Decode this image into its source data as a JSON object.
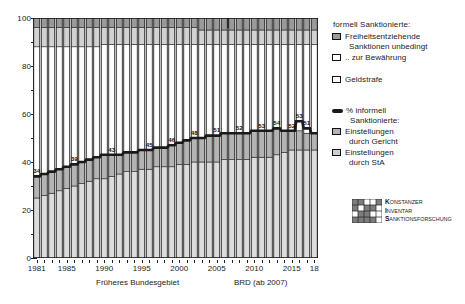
{
  "chart_data": {
    "type": "area",
    "title": "",
    "xlabel": "",
    "ylabel": "",
    "ylim": [
      0,
      100
    ],
    "xlim": [
      1981,
      2018
    ],
    "grid": false,
    "legend_position": "right",
    "y_ticks": [
      "0",
      "20",
      "40",
      "60",
      "80",
      "100"
    ],
    "y_tick_values": [
      0,
      20,
      40,
      60,
      80,
      100
    ],
    "y_minor_values": [
      10,
      30,
      50,
      70,
      90
    ],
    "x_ticks": [
      "1981",
      "1985",
      "1990",
      "1995",
      "2000",
      "2005",
      "2010",
      "2015",
      "18"
    ],
    "x_tick_values": [
      1981,
      1985,
      1990,
      1995,
      2000,
      2005,
      2010,
      2015,
      2018
    ],
    "x": [
      1981,
      1982,
      1983,
      1984,
      1985,
      1986,
      1987,
      1988,
      1989,
      1990,
      1991,
      1992,
      1993,
      1994,
      1995,
      1996,
      1997,
      1998,
      1999,
      2000,
      2001,
      2002,
      2003,
      2004,
      2005,
      2006,
      2007,
      2008,
      2009,
      2010,
      2011,
      2012,
      2013,
      2014,
      2015,
      2016,
      2017,
      2018
    ],
    "series": [
      {
        "name": "Einstellungen durch StA",
        "key": "einstellungen_sta",
        "color": "#dcdcdc",
        "values": [
          25,
          26,
          27,
          28,
          29,
          30,
          31,
          32,
          33,
          33,
          34,
          35,
          36,
          36,
          37,
          37,
          38,
          38,
          38,
          39,
          39,
          40,
          40,
          40,
          40,
          41,
          41,
          41,
          41,
          42,
          42,
          42,
          43,
          44,
          45,
          45,
          45,
          45
        ]
      },
      {
        "name": "Einstellungen durch Gericht",
        "key": "einstellungen_gericht",
        "color": "#b4b4b4",
        "values": [
          9,
          9,
          9,
          9,
          9,
          9,
          9,
          9,
          9,
          10,
          9,
          8,
          8,
          8,
          8,
          8,
          8,
          8,
          9,
          9,
          10,
          10,
          10,
          11,
          11,
          11,
          11,
          11,
          11,
          11,
          11,
          11,
          11,
          9,
          8,
          8,
          7,
          7
        ]
      },
      {
        "name": "Geldstrafe",
        "key": "geldstrafe",
        "color": "#ffffff",
        "values": [
          54,
          53,
          52,
          51,
          50,
          49,
          48,
          47,
          46,
          46,
          46,
          46,
          45,
          45,
          44,
          44,
          43,
          43,
          42,
          41,
          40,
          39,
          39,
          38,
          38,
          37,
          37,
          37,
          37,
          36,
          36,
          36,
          35,
          36,
          36,
          36,
          37,
          37
        ]
      },
      {
        "name": ".. zur Bewährung",
        "key": "zur_bewaehrung",
        "color": "#d2d2d2",
        "values": [
          8,
          8,
          8,
          8,
          8,
          8,
          8,
          8,
          8,
          7,
          7,
          7,
          7,
          7,
          7,
          7,
          7,
          7,
          7,
          7,
          7,
          7,
          6,
          6,
          6,
          6,
          6,
          6,
          6,
          6,
          6,
          6,
          6,
          6,
          6,
          6,
          6,
          6
        ]
      },
      {
        "name": "Freiheitsentziehende Sanktionen unbedingt",
        "key": "freiheitsentziehend_unbedingt",
        "color": "#9a9a9a",
        "values": [
          4,
          4,
          4,
          4,
          4,
          4,
          4,
          4,
          4,
          4,
          4,
          4,
          4,
          4,
          4,
          4,
          4,
          4,
          4,
          4,
          4,
          4,
          5,
          5,
          5,
          5,
          5,
          5,
          5,
          5,
          5,
          5,
          5,
          5,
          5,
          5,
          5,
          5
        ]
      }
    ],
    "informal_line": {
      "name": "% informell Sanktionierte",
      "color": "#1a1a1a",
      "values": [
        34,
        35,
        36,
        37,
        38,
        39,
        40,
        41,
        42,
        43,
        43,
        43,
        44,
        44,
        45,
        45,
        46,
        46,
        47,
        48,
        49,
        50,
        50,
        51,
        51,
        52,
        52,
        52,
        52,
        53,
        53,
        53,
        54,
        53,
        53,
        57,
        54,
        52
      ]
    },
    "point_labels": [
      {
        "x": 1981,
        "value": "34"
      },
      {
        "x": 1986,
        "value": "39"
      },
      {
        "x": 1991,
        "value": "43"
      },
      {
        "x": 1996,
        "value": "45"
      },
      {
        "x": 1999,
        "value": "46"
      },
      {
        "x": 2002,
        "value": "48"
      },
      {
        "x": 2005,
        "value": "51"
      },
      {
        "x": 2008,
        "value": "52"
      },
      {
        "x": 2011,
        "value": "53"
      },
      {
        "x": 2013,
        "value": "54"
      },
      {
        "x": 2015,
        "value": "52"
      },
      {
        "x": 2016,
        "value": "53"
      },
      {
        "x": 2017,
        "value": "51"
      }
    ]
  },
  "axis": {
    "region_left_label": "Früheres Bundesgebiet",
    "region_right_label": "BRD (ab 2007)",
    "divider_year": 2006
  },
  "legend": {
    "formal_title": "formell Sanktionierte:",
    "items_formal": [
      {
        "label_line1": "Freiheitsentziehende",
        "label_line2": "Sanktionen unbedingt",
        "swatch": "sw-dark"
      },
      {
        "label_line1": ".. zur Bewährung",
        "label_line2": "",
        "swatch": "sw-white"
      },
      {
        "label_line1": "Geldstrafe",
        "label_line2": "",
        "swatch": "sw-white"
      }
    ],
    "informal_title_line1": "% informell",
    "informal_title_line2": "Sanktionierte:",
    "items_informal": [
      {
        "label_line1": "Einstellungen",
        "label_line2": "durch Gericht",
        "swatch": "sw-mgray"
      },
      {
        "label_line1": "Einstellungen",
        "label_line2": "durch StA",
        "swatch": "sw-lgray"
      }
    ]
  },
  "branding": {
    "line1_first": "K",
    "line1_rest": "ONSTANZER",
    "line2_first": "I",
    "line2_rest": "NVENTAR",
    "line3_first": "S",
    "line3_rest": "ANKTIONSFORSCHUNG"
  },
  "colors": {
    "band_sta": "#dcdcdc",
    "band_gericht": "#b4b4b4",
    "band_geldstrafe": "#ffffff",
    "band_bewaehrung": "#d2d2d2",
    "band_unbedingt": "#9a9a9a",
    "line": "#1a1a1a",
    "axis": "#222222"
  }
}
